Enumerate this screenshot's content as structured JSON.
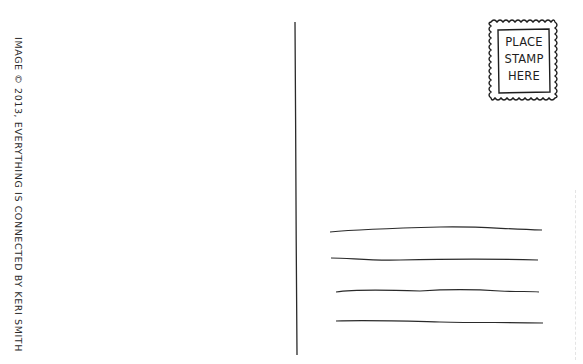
{
  "postcard": {
    "credit_text": "IMAGE © 2013, EVERYTHING IS CONNECTED  BY KERI SMITH",
    "stamp": {
      "lines": [
        "PLACE",
        "STAMP",
        "HERE"
      ]
    },
    "address_lines_count": 4,
    "ink_color": "#1e1e1e",
    "background_color": "#ffffff"
  }
}
